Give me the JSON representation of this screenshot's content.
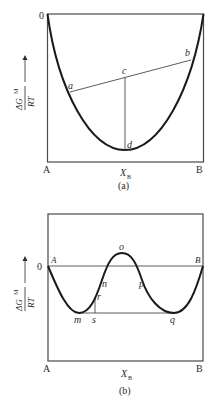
{
  "panels": [
    {
      "caption": "(a)",
      "zero_label": "0",
      "left_label": "A",
      "right_label": "B",
      "x_axis_label": "X",
      "x_axis_sub": "B",
      "y_axis_label_num": "ΔG",
      "y_axis_label_sup": "M",
      "y_axis_label_den": "RT",
      "points": {
        "a": "a",
        "b": "b",
        "c": "c",
        "d": "d"
      }
    },
    {
      "caption": "(b)",
      "zero_label": "0",
      "left_label": "A",
      "right_label": "B",
      "left_curve_label": "A",
      "right_curve_label": "B",
      "x_axis_label": "X",
      "x_axis_sub": "B",
      "y_axis_label_num": "ΔG",
      "y_axis_label_sup": "M",
      "y_axis_label_den": "RT",
      "points": {
        "m": "m",
        "n": "n",
        "o": "o",
        "p": "p",
        "q": "q",
        "r": "r",
        "s": "s"
      }
    }
  ],
  "colors": {
    "line": "#4a4a4a",
    "curve": "#1a1a1a",
    "text": "#2b2b2b"
  }
}
